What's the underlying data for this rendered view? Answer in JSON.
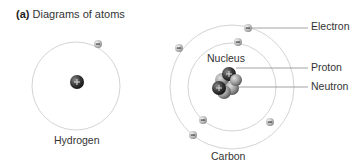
{
  "figure": {
    "panel_letter": "(a)",
    "title": "Diagrams of atoms"
  },
  "atoms": [
    {
      "name": "Hydrogen",
      "label": "Hydrogen",
      "electrons": 1,
      "orbits": 1
    },
    {
      "name": "Carbon",
      "label": "Carbon",
      "electrons": 6,
      "orbits": 2
    }
  ],
  "labels": {
    "electron": "Electron",
    "nucleus": "Nucleus",
    "proton": "Proton",
    "neutron": "Neutron"
  },
  "symbols": {
    "proton_sign": "+",
    "electron_sign": "−"
  },
  "colors": {
    "orbit": "#c8c8c8",
    "electron_fill": "#bdbdbd",
    "proton_fill": "#3a3a3a",
    "neutron_fill": "#9a9a9a",
    "leader_line": "#8a8a8a",
    "text": "#333333"
  }
}
